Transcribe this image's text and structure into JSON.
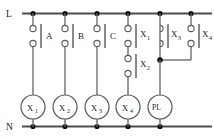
{
  "diagram": {
    "type": "ladder-logic-relay-diagram",
    "rails": {
      "line_label": "L",
      "neutral_label": "N"
    },
    "rungs": [
      {
        "id": "rung-a",
        "contacts": [
          {
            "label": "A",
            "sub": "",
            "type": "normally-open"
          }
        ],
        "output": {
          "label": "X",
          "sub": "1",
          "type": "relay-coil"
        }
      },
      {
        "id": "rung-b",
        "contacts": [
          {
            "label": "B",
            "sub": "",
            "type": "normally-open"
          }
        ],
        "output": {
          "label": "X",
          "sub": "2",
          "type": "relay-coil"
        }
      },
      {
        "id": "rung-c",
        "contacts": [
          {
            "label": "C",
            "sub": "",
            "type": "normally-open"
          }
        ],
        "output": {
          "label": "X",
          "sub": "3",
          "type": "relay-coil"
        }
      },
      {
        "id": "rung-x4",
        "contacts": [
          {
            "label": "X",
            "sub": "1",
            "type": "normally-open"
          },
          {
            "label": "X",
            "sub": "2",
            "type": "normally-open"
          }
        ],
        "output": {
          "label": "X",
          "sub": "4",
          "type": "relay-coil"
        }
      },
      {
        "id": "rung-pl",
        "contacts": [
          {
            "label": "X",
            "sub": "3",
            "type": "normally-closed"
          },
          {
            "label": "X",
            "sub": "4",
            "type": "normally-open"
          }
        ],
        "output": {
          "label": "PL",
          "sub": "",
          "type": "pilot-lamp"
        }
      }
    ],
    "colors": {
      "rail": "#4c4c4c",
      "wire": "#6e6e6e",
      "node": "#111111",
      "outline": "#5a5a5a",
      "text": "#1a1a1a",
      "background": "#ffffff"
    }
  }
}
